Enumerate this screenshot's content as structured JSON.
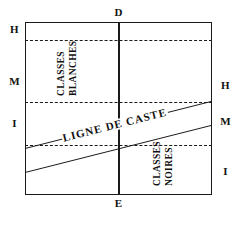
{
  "figure": {
    "name": "caste-line-diagram",
    "type": "diagram"
  },
  "axes": {
    "top_label": "D",
    "bottom_label": "E"
  },
  "left_scale": {
    "labels": [
      "H",
      "M",
      "I"
    ]
  },
  "right_scale": {
    "labels": [
      "H",
      "M",
      "I"
    ]
  },
  "regions": {
    "upper_left": {
      "line1": "CLASSES",
      "line2": "BLANCHES"
    },
    "lower_right": {
      "line1": "CLASSES",
      "line2": "NOIRES"
    }
  },
  "band": {
    "label": "LIGNE DE CASTE"
  },
  "colors": {
    "ink": "#1a1a1a",
    "paper": "#ffffff"
  }
}
